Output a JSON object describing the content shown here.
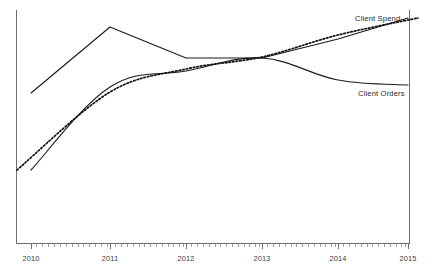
{
  "chart_data": {
    "type": "line",
    "title": "",
    "subtitle": "",
    "xlabel": "",
    "ylabel": "",
    "x": [
      2010,
      2011,
      2012,
      2013,
      2014,
      2015
    ],
    "xtick_labels": [
      "2010",
      "2011",
      "2012",
      "2013",
      "2014",
      "2015"
    ],
    "xlim": [
      2009.8,
      2015.0
    ],
    "ylim": [
      0,
      100
    ],
    "grid": false,
    "legend_position": "inline-end-of-line",
    "axis_style": "left-and-bottom-spine",
    "y_axis_ticks_shown": false,
    "minor_ticks_per_interval": 13,
    "series": [
      {
        "name": "Client Spend",
        "style": "solid",
        "label": "Client Spend",
        "label_x": 2014.28,
        "label_y": 96.5,
        "values": [
          68.5,
          96.0,
          81.5,
          81.5,
          87.0,
          98.5
        ],
        "points_px": [
          [
            31,
            93
          ],
          [
            110,
            27
          ],
          [
            186,
            58
          ],
          [
            262,
            58
          ],
          [
            338,
            39
          ],
          [
            408,
            18
          ]
        ]
      },
      {
        "name": "Client Orders",
        "style": "solid",
        "label": "Client Orders",
        "label_x": 2014.27,
        "label_y": 66.0,
        "values": [
          27.0,
          61.5,
          74.5,
          81.5,
          72.0,
          69.5
        ],
        "points_px": [
          [
            31,
            170
          ],
          [
            110,
            87
          ],
          [
            186,
            71
          ],
          [
            262,
            58
          ],
          [
            338,
            80
          ],
          [
            408,
            85
          ]
        ]
      },
      {
        "name": "Trend",
        "style": "dotted",
        "label": "",
        "values": [
          27.0,
          62.0,
          75.0,
          81.5,
          89.0,
          99.5
        ],
        "points_px": [
          [
            17,
            170
          ],
          [
            110,
            92
          ],
          [
            186,
            69
          ],
          [
            262,
            57
          ],
          [
            338,
            35
          ],
          [
            418,
            18
          ]
        ]
      }
    ],
    "annotations": [
      {
        "text": "Client Spend",
        "target_series": "Client Spend"
      },
      {
        "text": "Client Orders",
        "target_series": "Client Orders"
      }
    ],
    "colors": {
      "series_stroke": "#1b1b1b",
      "trend_stroke": "#111111",
      "axis": "#6f6f6f",
      "tick_label": "#3a3a3a",
      "background": "#ffffff"
    }
  },
  "labels": {
    "spend": "Client Spend",
    "orders": "Client Orders"
  },
  "xticks": {
    "t0": "2010",
    "t1": "2011",
    "t2": "2012",
    "t3": "2013",
    "t4": "2014",
    "t5": "2015"
  }
}
